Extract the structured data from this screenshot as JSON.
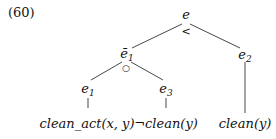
{
  "example_number": "(60)",
  "tree": {
    "root": {
      "label": "e",
      "operator": "<"
    },
    "left": {
      "label": "ē",
      "sub": "1",
      "operator": "○"
    },
    "right": {
      "label": "e",
      "sub": "2"
    },
    "left_left": {
      "label": "e",
      "sub": "1"
    },
    "left_right": {
      "label": "e",
      "sub": "3"
    },
    "leaves": {
      "leaf1": "clean_act(x, y)",
      "leaf2": "¬clean(y)",
      "leaf3": "clean(y)"
    }
  }
}
